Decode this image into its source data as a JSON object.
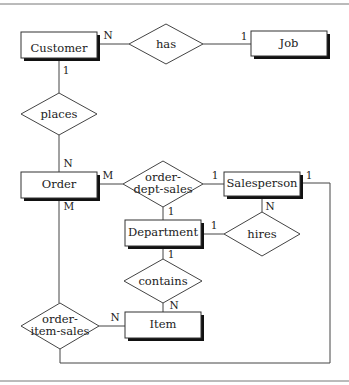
{
  "diagram": {
    "type": "er-diagram",
    "entities": [
      {
        "id": "customer",
        "label": "Customer"
      },
      {
        "id": "job",
        "label": "Job"
      },
      {
        "id": "order",
        "label": "Order"
      },
      {
        "id": "salesperson",
        "label": "Salesperson"
      },
      {
        "id": "department",
        "label": "Department"
      },
      {
        "id": "item",
        "label": "Item"
      }
    ],
    "relationships": [
      {
        "id": "has",
        "label": "has",
        "line1": "has"
      },
      {
        "id": "places",
        "label": "places",
        "line1": "places"
      },
      {
        "id": "order_dept_sales",
        "label": "order-dept-sales",
        "line1": "order-",
        "line2": "dept-sales"
      },
      {
        "id": "hires",
        "label": "hires",
        "line1": "hires"
      },
      {
        "id": "contains",
        "label": "contains",
        "line1": "contains"
      },
      {
        "id": "order_item_sales",
        "label": "order-item-sales",
        "line1": "order-",
        "line2": "item-sales"
      }
    ],
    "cardinalities": {
      "customer_has": "N",
      "has_job": "1",
      "customer_places": "1",
      "places_order": "N",
      "order_ods": "M",
      "ods_salesperson": "1",
      "ods_department": "1",
      "salesperson_hires": "N",
      "department_hires": "1",
      "department_contains": "1",
      "contains_item": "N",
      "order_ois": "M",
      "ois_item": "N",
      "salesperson_ois": "1"
    }
  }
}
